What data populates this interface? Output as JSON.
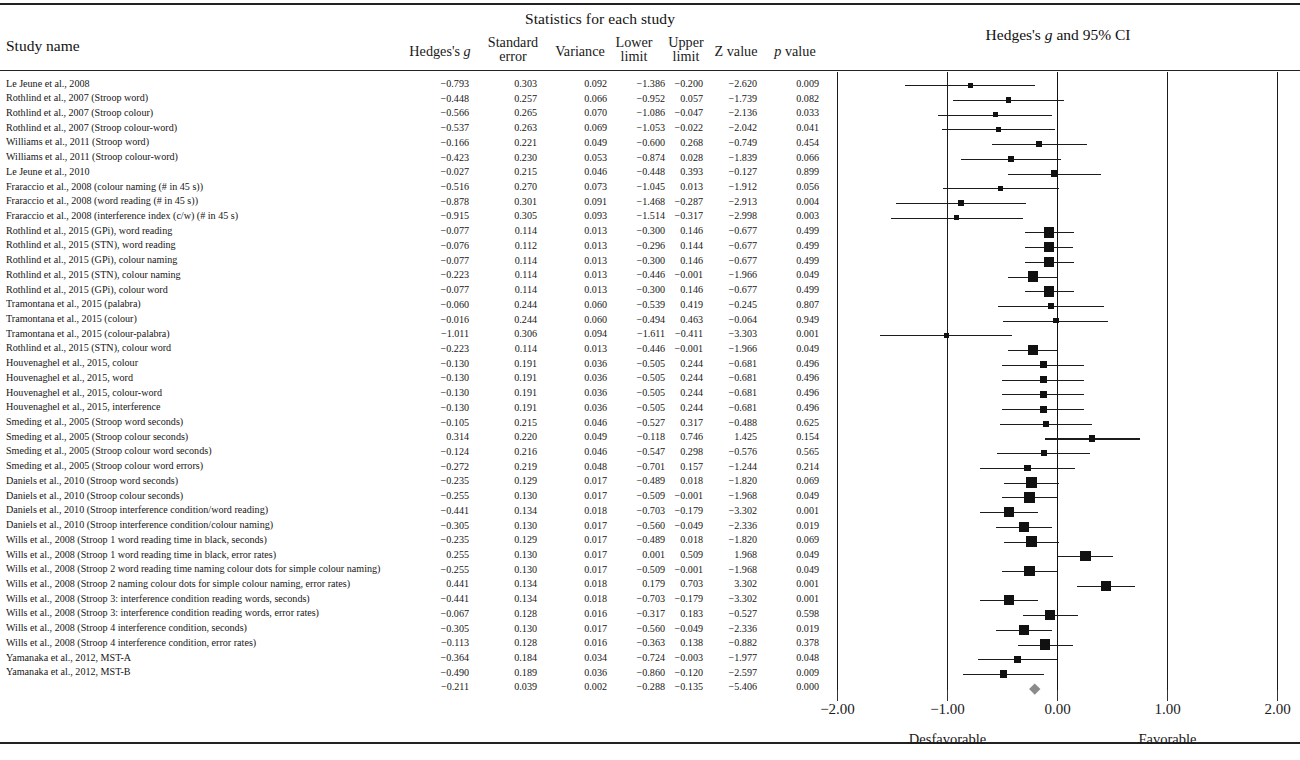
{
  "header": {
    "group_title": "Statistics for each study",
    "study_name_label": "Study name",
    "plot_title_pre": "Hedges's ",
    "plot_title_g": "g",
    "plot_title_post": " and 95% CI",
    "columns": [
      {
        "id": "hedges_g",
        "l1": "Hedges's ",
        "l1i": "g",
        "l2": ""
      },
      {
        "id": "standard_error",
        "l1": "Standard",
        "l1i": "",
        "l2": "error"
      },
      {
        "id": "variance",
        "l1": "Variance",
        "l1i": "",
        "l2": ""
      },
      {
        "id": "lower_limit",
        "l1": "Lower",
        "l1i": "",
        "l2": "limit"
      },
      {
        "id": "upper_limit",
        "l1": "Upper",
        "l1i": "",
        "l2": "limit"
      },
      {
        "id": "z_value",
        "l1": "Z value",
        "l1i": "",
        "l2": ""
      },
      {
        "id": "p_value",
        "l1": " value",
        "l1i": "p",
        "l2": ""
      }
    ]
  },
  "axis": {
    "ticks": [
      "−2.00",
      "−1.00",
      "0.00",
      "1.00",
      "2.00"
    ],
    "tick_values": [
      -2,
      -1,
      0,
      1,
      2
    ],
    "left_label": "Desfavorable",
    "right_label": "Favorable"
  },
  "chart_data": {
    "type": "forest",
    "title": "Hedges's g and 95% CI",
    "xlabel": "",
    "ylabel": "",
    "xlim": [
      -2.5,
      2.5
    ],
    "grid": true,
    "effect_measure": "Hedges's g",
    "ci_level": "95%",
    "direction_left": "Desfavorable",
    "direction_right": "Favorable",
    "columns": [
      "Study name",
      "Hedges's g",
      "Standard error",
      "Variance",
      "Lower limit",
      "Upper limit",
      "Z value",
      "p value"
    ],
    "rows": [
      {
        "name": "Le Jeune et al., 2008",
        "g": -0.793,
        "se": 0.303,
        "var": 0.092,
        "lower": -1.386,
        "upper": -0.2,
        "z": -2.62,
        "p": 0.009,
        "g_t": "−0.793",
        "se_t": "0.303",
        "var_t": "0.092",
        "lower_t": "−1.386",
        "upper_t": "−0.200",
        "z_t": "−2.620",
        "p_t": "0.009"
      },
      {
        "name": "Rothlind et al., 2007 (Stroop word)",
        "g": -0.448,
        "se": 0.257,
        "var": 0.066,
        "lower": -0.952,
        "upper": 0.057,
        "z": -1.739,
        "p": 0.082,
        "g_t": "−0.448",
        "se_t": "0.257",
        "var_t": "0.066",
        "lower_t": "−0.952",
        "upper_t": "0.057",
        "z_t": "−1.739",
        "p_t": "0.082"
      },
      {
        "name": "Rothlind et al., 2007 (Stroop colour)",
        "g": -0.566,
        "se": 0.265,
        "var": 0.07,
        "lower": -1.086,
        "upper": -0.047,
        "z": -2.136,
        "p": 0.033,
        "g_t": "−0.566",
        "se_t": "0.265",
        "var_t": "0.070",
        "lower_t": "−1.086",
        "upper_t": "−0.047",
        "z_t": "−2.136",
        "p_t": "0.033"
      },
      {
        "name": "Rothlind et al., 2007 (Stroop colour-word)",
        "g": -0.537,
        "se": 0.263,
        "var": 0.069,
        "lower": -1.053,
        "upper": -0.022,
        "z": -2.042,
        "p": 0.041,
        "g_t": "−0.537",
        "se_t": "0.263",
        "var_t": "0.069",
        "lower_t": "−1.053",
        "upper_t": "−0.022",
        "z_t": "−2.042",
        "p_t": "0.041"
      },
      {
        "name": "Williams et al., 2011 (Stroop word)",
        "g": -0.166,
        "se": 0.221,
        "var": 0.049,
        "lower": -0.6,
        "upper": 0.268,
        "z": -0.749,
        "p": 0.454,
        "g_t": "−0.166",
        "se_t": "0.221",
        "var_t": "0.049",
        "lower_t": "−0.600",
        "upper_t": "0.268",
        "z_t": "−0.749",
        "p_t": "0.454"
      },
      {
        "name": "Williams et al., 2011 (Stroop colour-word)",
        "g": -0.423,
        "se": 0.23,
        "var": 0.053,
        "lower": -0.874,
        "upper": 0.028,
        "z": -1.839,
        "p": 0.066,
        "g_t": "−0.423",
        "se_t": "0.230",
        "var_t": "0.053",
        "lower_t": "−0.874",
        "upper_t": "0.028",
        "z_t": "−1.839",
        "p_t": "0.066"
      },
      {
        "name": "Le Jeune et al., 2010",
        "g": -0.027,
        "se": 0.215,
        "var": 0.046,
        "lower": -0.448,
        "upper": 0.393,
        "z": -0.127,
        "p": 0.899,
        "g_t": "−0.027",
        "se_t": "0.215",
        "var_t": "0.046",
        "lower_t": "−0.448",
        "upper_t": "0.393",
        "z_t": "−0.127",
        "p_t": "0.899"
      },
      {
        "name": "Fraraccio et al., 2008 (colour naming (# in 45 s))",
        "g": -0.516,
        "se": 0.27,
        "var": 0.073,
        "lower": -1.045,
        "upper": 0.013,
        "z": -1.912,
        "p": 0.056,
        "g_t": "−0.516",
        "se_t": "0.270",
        "var_t": "0.073",
        "lower_t": "−1.045",
        "upper_t": "0.013",
        "z_t": "−1.912",
        "p_t": "0.056"
      },
      {
        "name": "Fraraccio et al., 2008 (word reading (# in 45 s))",
        "g": -0.878,
        "se": 0.301,
        "var": 0.091,
        "lower": -1.468,
        "upper": -0.287,
        "z": -2.913,
        "p": 0.004,
        "g_t": "−0.878",
        "se_t": "0.301",
        "var_t": "0.091",
        "lower_t": "−1.468",
        "upper_t": "−0.287",
        "z_t": "−2.913",
        "p_t": "0.004"
      },
      {
        "name": "Fraraccio et al., 2008 (interference index (c/w) (# in 45 s)",
        "g": -0.915,
        "se": 0.305,
        "var": 0.093,
        "lower": -1.514,
        "upper": -0.317,
        "z": -2.998,
        "p": 0.003,
        "g_t": "−0.915",
        "se_t": "0.305",
        "var_t": "0.093",
        "lower_t": "−1.514",
        "upper_t": "−0.317",
        "z_t": "−2.998",
        "p_t": "0.003"
      },
      {
        "name": "Rothlind et al., 2015 (GPi), word reading",
        "g": -0.077,
        "se": 0.114,
        "var": 0.013,
        "lower": -0.3,
        "upper": 0.146,
        "z": -0.677,
        "p": 0.499,
        "g_t": "−0.077",
        "se_t": "0.114",
        "var_t": "0.013",
        "lower_t": "−0.300",
        "upper_t": "0.146",
        "z_t": "−0.677",
        "p_t": "0.499"
      },
      {
        "name": "Rothlind et al., 2015 (STN), word reading",
        "g": -0.076,
        "se": 0.112,
        "var": 0.013,
        "lower": -0.296,
        "upper": 0.144,
        "z": -0.677,
        "p": 0.499,
        "g_t": "−0.076",
        "se_t": "0.112",
        "var_t": "0.013",
        "lower_t": "−0.296",
        "upper_t": "0.144",
        "z_t": "−0.677",
        "p_t": "0.499"
      },
      {
        "name": "Rothlind et al., 2015 (GPi), colour naming",
        "g": -0.077,
        "se": 0.114,
        "var": 0.013,
        "lower": -0.3,
        "upper": 0.146,
        "z": -0.677,
        "p": 0.499,
        "g_t": "−0.077",
        "se_t": "0.114",
        "var_t": "0.013",
        "lower_t": "−0.300",
        "upper_t": "0.146",
        "z_t": "−0.677",
        "p_t": "0.499"
      },
      {
        "name": "Rothlind et al., 2015 (STN), colour naming",
        "g": -0.223,
        "se": 0.114,
        "var": 0.013,
        "lower": -0.446,
        "upper": -0.001,
        "z": -1.966,
        "p": 0.049,
        "g_t": "−0.223",
        "se_t": "0.114",
        "var_t": "0.013",
        "lower_t": "−0.446",
        "upper_t": "−0.001",
        "z_t": "−1.966",
        "p_t": "0.049"
      },
      {
        "name": "Rothlind et al., 2015 (GPi), colour word",
        "g": -0.077,
        "se": 0.114,
        "var": 0.013,
        "lower": -0.3,
        "upper": 0.146,
        "z": -0.677,
        "p": 0.499,
        "g_t": "−0.077",
        "se_t": "0.114",
        "var_t": "0.013",
        "lower_t": "−0.300",
        "upper_t": "0.146",
        "z_t": "−0.677",
        "p_t": "0.499"
      },
      {
        "name": "Tramontana et al., 2015 (palabra)",
        "g": -0.06,
        "se": 0.244,
        "var": 0.06,
        "lower": -0.539,
        "upper": 0.419,
        "z": -0.245,
        "p": 0.807,
        "g_t": "−0.060",
        "se_t": "0.244",
        "var_t": "0.060",
        "lower_t": "−0.539",
        "upper_t": "0.419",
        "z_t": "−0.245",
        "p_t": "0.807"
      },
      {
        "name": "Tramontana et al., 2015 (colour)",
        "g": -0.016,
        "se": 0.244,
        "var": 0.06,
        "lower": -0.494,
        "upper": 0.463,
        "z": -0.064,
        "p": 0.949,
        "g_t": "−0.016",
        "se_t": "0.244",
        "var_t": "0.060",
        "lower_t": "−0.494",
        "upper_t": "0.463",
        "z_t": "−0.064",
        "p_t": "0.949"
      },
      {
        "name": "Tramontana et al., 2015 (colour-palabra)",
        "g": -1.011,
        "se": 0.306,
        "var": 0.094,
        "lower": -1.611,
        "upper": -0.411,
        "z": -3.303,
        "p": 0.001,
        "g_t": "−1.011",
        "se_t": "0.306",
        "var_t": "0.094",
        "lower_t": "−1.611",
        "upper_t": "−0.411",
        "z_t": "−3.303",
        "p_t": "0.001"
      },
      {
        "name": "Rothlind et al., 2015 (STN), colour word",
        "g": -0.223,
        "se": 0.114,
        "var": 0.013,
        "lower": -0.446,
        "upper": -0.001,
        "z": -1.966,
        "p": 0.049,
        "g_t": "−0.223",
        "se_t": "0.114",
        "var_t": "0.013",
        "lower_t": "−0.446",
        "upper_t": "−0.001",
        "z_t": "−1.966",
        "p_t": "0.049"
      },
      {
        "name": "Houvenaghel et al., 2015, colour",
        "g": -0.13,
        "se": 0.191,
        "var": 0.036,
        "lower": -0.505,
        "upper": 0.244,
        "z": -0.681,
        "p": 0.496,
        "g_t": "−0.130",
        "se_t": "0.191",
        "var_t": "0.036",
        "lower_t": "−0.505",
        "upper_t": "0.244",
        "z_t": "−0.681",
        "p_t": "0.496"
      },
      {
        "name": "Houvenaghel et al., 2015, word",
        "g": -0.13,
        "se": 0.191,
        "var": 0.036,
        "lower": -0.505,
        "upper": 0.244,
        "z": -0.681,
        "p": 0.496,
        "g_t": "−0.130",
        "se_t": "0.191",
        "var_t": "0.036",
        "lower_t": "−0.505",
        "upper_t": "0.244",
        "z_t": "−0.681",
        "p_t": "0.496"
      },
      {
        "name": "Houvenaghel et al., 2015, colour-word",
        "g": -0.13,
        "se": 0.191,
        "var": 0.036,
        "lower": -0.505,
        "upper": 0.244,
        "z": -0.681,
        "p": 0.496,
        "g_t": "−0.130",
        "se_t": "0.191",
        "var_t": "0.036",
        "lower_t": "−0.505",
        "upper_t": "0.244",
        "z_t": "−0.681",
        "p_t": "0.496"
      },
      {
        "name": "Houvenaghel et al., 2015, interference",
        "g": -0.13,
        "se": 0.191,
        "var": 0.036,
        "lower": -0.505,
        "upper": 0.244,
        "z": -0.681,
        "p": 0.496,
        "g_t": "−0.130",
        "se_t": "0.191",
        "var_t": "0.036",
        "lower_t": "−0.505",
        "upper_t": "0.244",
        "z_t": "−0.681",
        "p_t": "0.496"
      },
      {
        "name": "Smeding et al., 2005 (Stroop word seconds)",
        "g": -0.105,
        "se": 0.215,
        "var": 0.046,
        "lower": -0.527,
        "upper": 0.317,
        "z": -0.488,
        "p": 0.625,
        "g_t": "−0.105",
        "se_t": "0.215",
        "var_t": "0.046",
        "lower_t": "−0.527",
        "upper_t": "0.317",
        "z_t": "−0.488",
        "p_t": "0.625"
      },
      {
        "name": "Smeding et al., 2005 (Stroop colour seconds)",
        "g": 0.314,
        "se": 0.22,
        "var": 0.049,
        "lower": -0.118,
        "upper": 0.746,
        "z": 1.425,
        "p": 0.154,
        "g_t": "0.314",
        "se_t": "0.220",
        "var_t": "0.049",
        "lower_t": "−0.118",
        "upper_t": "0.746",
        "z_t": "1.425",
        "p_t": "0.154"
      },
      {
        "name": "Smeding et al., 2005 (Stroop colour word seconds)",
        "g": -0.124,
        "se": 0.216,
        "var": 0.046,
        "lower": -0.547,
        "upper": 0.298,
        "z": -0.576,
        "p": 0.565,
        "g_t": "−0.124",
        "se_t": "0.216",
        "var_t": "0.046",
        "lower_t": "−0.547",
        "upper_t": "0.298",
        "z_t": "−0.576",
        "p_t": "0.565"
      },
      {
        "name": "Smeding et al., 2005 (Stroop colour word errors)",
        "g": -0.272,
        "se": 0.219,
        "var": 0.048,
        "lower": -0.701,
        "upper": 0.157,
        "z": -1.244,
        "p": 0.214,
        "g_t": "−0.272",
        "se_t": "0.219",
        "var_t": "0.048",
        "lower_t": "−0.701",
        "upper_t": "0.157",
        "z_t": "−1.244",
        "p_t": "0.214"
      },
      {
        "name": "Daniels et al., 2010 (Stroop word seconds)",
        "g": -0.235,
        "se": 0.129,
        "var": 0.017,
        "lower": -0.489,
        "upper": 0.018,
        "z": -1.82,
        "p": 0.069,
        "g_t": "−0.235",
        "se_t": "0.129",
        "var_t": "0.017",
        "lower_t": "−0.489",
        "upper_t": "0.018",
        "z_t": "−1.820",
        "p_t": "0.069"
      },
      {
        "name": "Daniels et al., 2010 (Stroop colour seconds)",
        "g": -0.255,
        "se": 0.13,
        "var": 0.017,
        "lower": -0.509,
        "upper": -0.001,
        "z": -1.968,
        "p": 0.049,
        "g_t": "−0.255",
        "se_t": "0.130",
        "var_t": "0.017",
        "lower_t": "−0.509",
        "upper_t": "−0.001",
        "z_t": "−1.968",
        "p_t": "0.049"
      },
      {
        "name": "Daniels et al., 2010 (Stroop interference condition/word reading)",
        "g": -0.441,
        "se": 0.134,
        "var": 0.018,
        "lower": -0.703,
        "upper": -0.179,
        "z": -3.302,
        "p": 0.001,
        "g_t": "−0.441",
        "se_t": "0.134",
        "var_t": "0.018",
        "lower_t": "−0.703",
        "upper_t": "−0.179",
        "z_t": "−3.302",
        "p_t": "0.001"
      },
      {
        "name": "Daniels et al., 2010 (Stroop interference condition/colour naming)",
        "g": -0.305,
        "se": 0.13,
        "var": 0.017,
        "lower": -0.56,
        "upper": -0.049,
        "z": -2.336,
        "p": 0.019,
        "g_t": "−0.305",
        "se_t": "0.130",
        "var_t": "0.017",
        "lower_t": "−0.560",
        "upper_t": "−0.049",
        "z_t": "−2.336",
        "p_t": "0.019"
      },
      {
        "name": "Wills et al., 2008 (Stroop 1 word reading time in black, seconds)",
        "g": -0.235,
        "se": 0.129,
        "var": 0.017,
        "lower": -0.489,
        "upper": 0.018,
        "z": -1.82,
        "p": 0.069,
        "g_t": "−0.235",
        "se_t": "0.129",
        "var_t": "0.017",
        "lower_t": "−0.489",
        "upper_t": "0.018",
        "z_t": "−1.820",
        "p_t": "0.069"
      },
      {
        "name": "Wills et al., 2008 (Stroop 1 word reading time in black, error rates)",
        "g": 0.255,
        "se": 0.13,
        "var": 0.017,
        "lower": 0.001,
        "upper": 0.509,
        "z": 1.968,
        "p": 0.049,
        "g_t": "0.255",
        "se_t": "0.130",
        "var_t": "0.017",
        "lower_t": "0.001",
        "upper_t": "0.509",
        "z_t": "1.968",
        "p_t": "0.049"
      },
      {
        "name": "Wills et al., 2008 (Stroop 2 word reading time naming colour dots for simple colour naming)",
        "g": -0.255,
        "se": 0.13,
        "var": 0.017,
        "lower": -0.509,
        "upper": -0.001,
        "z": -1.968,
        "p": 0.049,
        "g_t": "−0.255",
        "se_t": "0.130",
        "var_t": "0.017",
        "lower_t": "−0.509",
        "upper_t": "−0.001",
        "z_t": "−1.968",
        "p_t": "0.049"
      },
      {
        "name": "Wills et al., 2008 (Stroop 2 naming colour dots for simple colour naming, error rates)",
        "g": 0.441,
        "se": 0.134,
        "var": 0.018,
        "lower": 0.179,
        "upper": 0.703,
        "z": 3.302,
        "p": 0.001,
        "g_t": "0.441",
        "se_t": "0.134",
        "var_t": "0.018",
        "lower_t": "0.179",
        "upper_t": "0.703",
        "z_t": "3.302",
        "p_t": "0.001"
      },
      {
        "name": "Wills et al., 2008 (Stroop 3: interference condition reading words, seconds)",
        "g": -0.441,
        "se": 0.134,
        "var": 0.018,
        "lower": -0.703,
        "upper": -0.179,
        "z": -3.302,
        "p": 0.001,
        "g_t": "−0.441",
        "se_t": "0.134",
        "var_t": "0.018",
        "lower_t": "−0.703",
        "upper_t": "−0.179",
        "z_t": "−3.302",
        "p_t": "0.001"
      },
      {
        "name": "Wills et al., 2008 (Stroop 3: interference condition reading words, error rates)",
        "g": -0.067,
        "se": 0.128,
        "var": 0.016,
        "lower": -0.317,
        "upper": 0.183,
        "z": -0.527,
        "p": 0.598,
        "g_t": "−0.067",
        "se_t": "0.128",
        "var_t": "0.016",
        "lower_t": "−0.317",
        "upper_t": "0.183",
        "z_t": "−0.527",
        "p_t": "0.598"
      },
      {
        "name": "Wills et al., 2008 (Stroop 4 interference condition, seconds)",
        "g": -0.305,
        "se": 0.13,
        "var": 0.017,
        "lower": -0.56,
        "upper": -0.049,
        "z": -2.336,
        "p": 0.019,
        "g_t": "−0.305",
        "se_t": "0.130",
        "var_t": "0.017",
        "lower_t": "−0.560",
        "upper_t": "−0.049",
        "z_t": "−2.336",
        "p_t": "0.019"
      },
      {
        "name": "Wills et al., 2008 (Stroop 4 interference condition, error rates)",
        "g": -0.113,
        "se": 0.128,
        "var": 0.016,
        "lower": -0.363,
        "upper": 0.138,
        "z": -0.882,
        "p": 0.378,
        "g_t": "−0.113",
        "se_t": "0.128",
        "var_t": "0.016",
        "lower_t": "−0.363",
        "upper_t": "0.138",
        "z_t": "−0.882",
        "p_t": "0.378"
      },
      {
        "name": "Yamanaka et al., 2012, MST-A",
        "g": -0.364,
        "se": 0.184,
        "var": 0.034,
        "lower": -0.724,
        "upper": -0.003,
        "z": -1.977,
        "p": 0.048,
        "g_t": "−0.364",
        "se_t": "0.184",
        "var_t": "0.034",
        "lower_t": "−0.724",
        "upper_t": "−0.003",
        "z_t": "−1.977",
        "p_t": "0.048"
      },
      {
        "name": "Yamanaka et al., 2012, MST-B",
        "g": -0.49,
        "se": 0.189,
        "var": 0.036,
        "lower": -0.86,
        "upper": -0.12,
        "z": -2.597,
        "p": 0.009,
        "g_t": "−0.490",
        "se_t": "0.189",
        "var_t": "0.036",
        "lower_t": "−0.860",
        "upper_t": "−0.120",
        "z_t": "−2.597",
        "p_t": "0.009"
      }
    ],
    "summary": {
      "name": "",
      "g": -0.211,
      "se": 0.039,
      "var": 0.002,
      "lower": -0.288,
      "upper": -0.135,
      "z": -5.406,
      "p": 0.0,
      "g_t": "−0.211",
      "se_t": "0.039",
      "var_t": "0.002",
      "lower_t": "−0.288",
      "upper_t": "−0.135",
      "z_t": "−5.406",
      "p_t": "0.000"
    }
  }
}
